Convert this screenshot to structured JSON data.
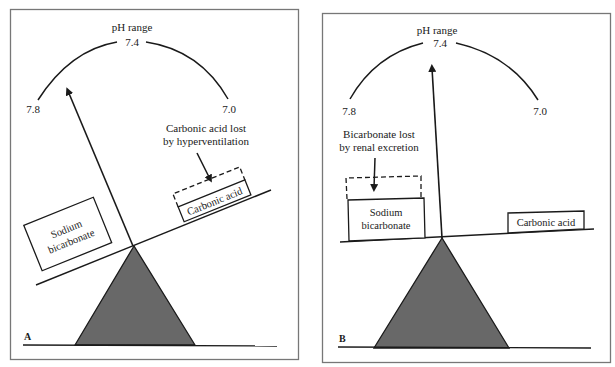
{
  "panels": [
    {
      "id": "A",
      "letter": "A",
      "title": "pH range",
      "scale": {
        "left": "7.8",
        "center": "7.4",
        "right": "7.0"
      },
      "left_weight": {
        "line1": "Sodium",
        "line2": "bicarbonate"
      },
      "right_weight": "Carbonic acid",
      "annotation": {
        "line1": "Carbonic acid lost",
        "line2": "by hyperventilation"
      }
    },
    {
      "id": "B",
      "letter": "B",
      "title": "pH range",
      "scale": {
        "left": "7.8",
        "center": "7.4",
        "right": "7.0"
      },
      "left_weight": {
        "line1": "Sodium",
        "line2": "bicarbonate"
      },
      "right_weight": "Carbonic acid",
      "annotation": {
        "line1": "Bicarbonate lost",
        "line2": "by renal excretion"
      }
    }
  ],
  "colors": {
    "line": "#1a1a1a",
    "fulcrum": "#686868",
    "border": "#777777"
  }
}
